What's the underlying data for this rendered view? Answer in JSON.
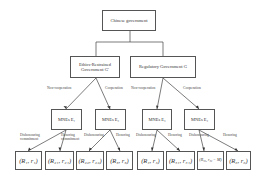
{
  "root": {
    "label": "Chinese government"
  },
  "level1": [
    {
      "label": "Ethics-Restrained Government G′"
    },
    {
      "label": "Regulatory Government G"
    }
  ],
  "edges_level1": [
    "Non-cooperation",
    "Cooperation",
    "Non-cooperation",
    "Cooperation"
  ],
  "level2": [
    {
      "label": "MNEs E₁"
    },
    {
      "label": "MNEs E₂"
    },
    {
      "label": "MNEs E₃"
    },
    {
      "label": "MNEs E₄"
    }
  ],
  "edges_level2": [
    "Dishonouring commitment",
    "Honoring commitment",
    "Dishonouring",
    "Honoring",
    "Dishonouring",
    "Honoring",
    "Dishonouring",
    "Honoring"
  ],
  "leaves": [
    {
      "label": "(R₁, r₁)"
    },
    {
      "label": "(R₂₁, r₂₁)"
    },
    {
      "label": "(R₂₂, r₂₂)"
    },
    {
      "label": "(R₃, r₃)"
    },
    {
      "label": "(R₄, r₄)"
    },
    {
      "label": "(R₅₁, r₅₁)"
    },
    {
      "label": "(R₅₂, r₅₂ − M)"
    },
    {
      "label": "(R₆, r₆)"
    }
  ]
}
